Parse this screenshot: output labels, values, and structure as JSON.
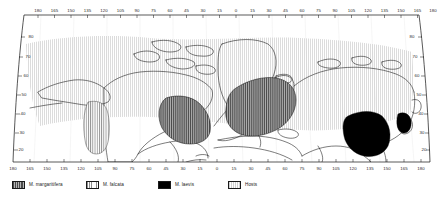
{
  "figure": {
    "type": "distribution-map",
    "projection": "curved conic (northern hemisphere)",
    "hemisphere": "northern"
  },
  "axes": {
    "longitude": {
      "label": "",
      "ticks": [
        "180",
        "165",
        "150",
        "135",
        "120",
        "105",
        "90",
        "75",
        "60",
        "45",
        "30",
        "15",
        "0",
        "15",
        "30",
        "45",
        "60",
        "75",
        "90",
        "105",
        "120",
        "135",
        "150",
        "165",
        "180"
      ]
    },
    "latitude": {
      "label": "",
      "ticks_left": [
        "80",
        "70",
        "60",
        "50",
        "40",
        "30",
        "20",
        "10"
      ],
      "ticks_right": [
        "80",
        "70",
        "60",
        "50",
        "40",
        "30",
        "20",
        "10"
      ]
    }
  },
  "legend": {
    "items": [
      {
        "label": "M. margaritifera",
        "pattern": "dark-vertical-hatch",
        "color": "#5a5a5a"
      },
      {
        "label": "M. falcata",
        "pattern": "light-vertical-hatch",
        "color": "#8d8d8d"
      },
      {
        "label": "M. laevis",
        "pattern": "solid-black",
        "color": "#000000"
      },
      {
        "label": "Hosts",
        "pattern": "light-stipple",
        "color": "#d9d9d9"
      }
    ]
  },
  "regions": [
    {
      "name": "hosts-range",
      "species": "Hosts",
      "area": "circum-boreal band across North America and Eurasia"
    },
    {
      "name": "m-falcata-western-north-america",
      "species": "M. falcata",
      "area": "Pacific Northwest coast of North America"
    },
    {
      "name": "m-margaritifera-eastern-north-america",
      "species": "M. margaritifera",
      "area": "eastern North America"
    },
    {
      "name": "m-margaritifera-europe",
      "species": "M. margaritifera",
      "area": "northern and western Europe"
    },
    {
      "name": "m-laevis-east-asia",
      "species": "M. laevis",
      "area": "Korea, Manchuria and northeast China"
    },
    {
      "name": "m-laevis-sakhalin-japan",
      "species": "M. laevis",
      "area": "Sakhalin and northern Japan"
    }
  ]
}
